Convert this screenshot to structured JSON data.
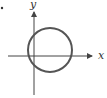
{
  "figure": {
    "type": "coordinate-plot",
    "axes": {
      "x_label": "x",
      "y_label": "y"
    },
    "shape": {
      "kind": "circle",
      "description": "Circle intersecting both axes, center in first quadrant near origin"
    },
    "colors": {
      "axis": "#444444",
      "circle": "#555555",
      "background": "#ffffff"
    },
    "marker": "•"
  }
}
